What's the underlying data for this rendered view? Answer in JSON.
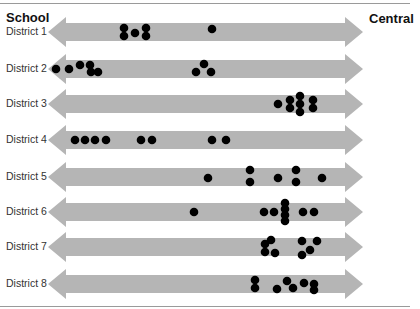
{
  "header": {
    "left_label": "School",
    "right_label": "Central"
  },
  "colors": {
    "arrow": "#b5b5b5",
    "dot": "#000000",
    "rule": "#9a9a9a"
  },
  "chart_data": {
    "type": "scatter",
    "title": "",
    "xlabel_left": "School",
    "xlabel_right": "Central",
    "axis": "horizontal double-headed arrows, no numeric ticks",
    "grid": false,
    "legend": null,
    "categories": [
      "District 1",
      "District 2",
      "District 3",
      "District 4",
      "District 5",
      "District 6",
      "District 7",
      "District 8"
    ],
    "x_pixel_range": [
      48,
      363
    ],
    "rows": [
      {
        "label": "District 1",
        "center_y": 32,
        "dots": [
          [
            124,
            28
          ],
          [
            124,
            36
          ],
          [
            135,
            33
          ],
          [
            146,
            28
          ],
          [
            146,
            36
          ],
          [
            212,
            29
          ]
        ]
      },
      {
        "label": "District 2",
        "center_y": 69,
        "dots": [
          [
            56,
            69
          ],
          [
            69,
            69
          ],
          [
            80,
            65
          ],
          [
            90,
            65
          ],
          [
            91,
            72
          ],
          [
            98,
            72
          ],
          [
            196,
            72
          ],
          [
            204,
            64
          ],
          [
            211,
            72
          ]
        ]
      },
      {
        "label": "District 3",
        "center_y": 104,
        "dots": [
          [
            278,
            104
          ],
          [
            290,
            100
          ],
          [
            290,
            108
          ],
          [
            300,
            96
          ],
          [
            300,
            104
          ],
          [
            300,
            112
          ],
          [
            313,
            100
          ],
          [
            313,
            108
          ]
        ]
      },
      {
        "label": "District 4",
        "center_y": 140,
        "dots": [
          [
            75,
            140
          ],
          [
            85,
            140
          ],
          [
            95,
            140
          ],
          [
            106,
            140
          ],
          [
            141,
            140
          ],
          [
            152,
            140
          ],
          [
            212,
            140
          ],
          [
            226,
            140
          ]
        ]
      },
      {
        "label": "District 5",
        "center_y": 177,
        "dots": [
          [
            208,
            178
          ],
          [
            250,
            170
          ],
          [
            250,
            182
          ],
          [
            278,
            178
          ],
          [
            296,
            170
          ],
          [
            296,
            182
          ],
          [
            322,
            178
          ]
        ]
      },
      {
        "label": "District 6",
        "center_y": 212,
        "dots": [
          [
            194,
            212
          ],
          [
            264,
            212
          ],
          [
            274,
            212
          ],
          [
            285,
            203
          ],
          [
            285,
            209
          ],
          [
            285,
            215
          ],
          [
            285,
            221
          ],
          [
            303,
            212
          ],
          [
            314,
            212
          ]
        ]
      },
      {
        "label": "District 7",
        "center_y": 247,
        "dots": [
          [
            265,
            244
          ],
          [
            271,
            240
          ],
          [
            265,
            252
          ],
          [
            275,
            253
          ],
          [
            302,
            241
          ],
          [
            317,
            241
          ],
          [
            310,
            250
          ],
          [
            302,
            255
          ]
        ]
      },
      {
        "label": "District 8",
        "center_y": 284,
        "dots": [
          [
            255,
            280
          ],
          [
            255,
            288
          ],
          [
            277,
            289
          ],
          [
            287,
            281
          ],
          [
            293,
            288
          ],
          [
            304,
            283
          ],
          [
            314,
            284
          ],
          [
            314,
            290
          ]
        ]
      }
    ]
  }
}
